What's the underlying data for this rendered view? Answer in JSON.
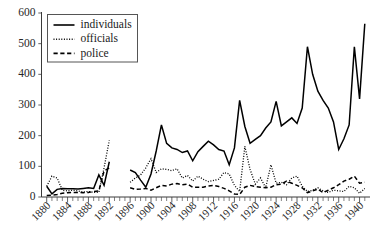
{
  "chart_data": {
    "type": "line",
    "title": "",
    "xlabel": "",
    "ylabel": "",
    "xlim": [
      1879,
      1942
    ],
    "ylim": [
      0,
      600
    ],
    "yticks": [
      0,
      100,
      200,
      300,
      400,
      500,
      600
    ],
    "xticks": [
      1880,
      1884,
      1888,
      1892,
      1896,
      1900,
      1904,
      1908,
      1912,
      1916,
      1920,
      1924,
      1928,
      1932,
      1936,
      1940
    ],
    "xtick_labels": [
      "1880",
      "1884",
      "1888",
      "1892",
      "1896",
      "1900",
      "1904",
      "1908",
      "1912",
      "1916",
      "1920",
      "1924",
      "1928",
      "1932",
      "1936",
      "1940"
    ],
    "ytick_labels": [
      "0",
      "100",
      "200",
      "300",
      "400",
      "500",
      "600"
    ],
    "xtick_minor_interval": 1,
    "grid": false,
    "legend_position": "upper-left",
    "legend_entries": [
      {
        "label": "individuals",
        "style": "solid"
      },
      {
        "label": "officials",
        "style": "dotted"
      },
      {
        "label": "police",
        "style": "dashed"
      }
    ],
    "series": [
      {
        "name": "individuals",
        "style": "solid",
        "segments": [
          {
            "x": [
              1880,
              1881,
              1882,
              1883,
              1884,
              1885,
              1886,
              1887,
              1888,
              1889,
              1890,
              1891,
              1892
            ],
            "values": [
              35,
              10,
              25,
              28,
              27,
              27,
              26,
              28,
              30,
              28,
              72,
              38,
              115
            ]
          },
          {
            "x": [
              1896,
              1897,
              1898,
              1899,
              1900,
              1901,
              1902,
              1903,
              1904,
              1905,
              1906,
              1907,
              1908,
              1909,
              1910,
              1911,
              1912,
              1913,
              1914,
              1915,
              1916,
              1917,
              1918,
              1919,
              1920,
              1921,
              1922,
              1923,
              1924,
              1925,
              1926,
              1927,
              1928,
              1929,
              1930,
              1931,
              1932,
              1933,
              1934,
              1935,
              1936,
              1937,
              1938,
              1939,
              1940,
              1941
            ],
            "values": [
              88,
              80,
              55,
              32,
              75,
              150,
              235,
              175,
              160,
              155,
              145,
              150,
              118,
              148,
              165,
              182,
              170,
              155,
              150,
              105,
              160,
              315,
              230,
              175,
              188,
              200,
              225,
              245,
              312,
              232,
              245,
              258,
              240,
              290,
              490,
              400,
              345,
              315,
              290,
              245,
              155,
              190,
              235,
              490,
              320,
              565
            ]
          }
        ]
      },
      {
        "name": "officials",
        "style": "dotted",
        "segments": [
          {
            "x": [
              1880,
              1881,
              1882,
              1883,
              1884,
              1885,
              1886,
              1887,
              1888,
              1889,
              1890,
              1891,
              1892
            ],
            "values": [
              35,
              68,
              62,
              22,
              20,
              22,
              20,
              16,
              18,
              15,
              15,
              95,
              185
            ]
          },
          {
            "x": [
              1896,
              1897,
              1898,
              1899,
              1900,
              1901,
              1902,
              1903,
              1904,
              1905,
              1906,
              1907,
              1908,
              1909,
              1910,
              1911,
              1912,
              1913,
              1914,
              1915,
              1916,
              1917,
              1918,
              1919,
              1920,
              1921,
              1922,
              1923,
              1924,
              1925,
              1926,
              1927,
              1928,
              1929,
              1930,
              1931,
              1932,
              1933,
              1934,
              1935,
              1936,
              1937,
              1938,
              1939,
              1940,
              1941
            ],
            "values": [
              48,
              62,
              72,
              95,
              125,
              80,
              92,
              90,
              86,
              92,
              62,
              70,
              52,
              68,
              58,
              50,
              54,
              58,
              80,
              75,
              38,
              18,
              165,
              90,
              42,
              62,
              30,
              105,
              45,
              48,
              40,
              62,
              68,
              35,
              18,
              22,
              30,
              20,
              15,
              22,
              20,
              18,
              35,
              30,
              12,
              28
            ]
          }
        ]
      },
      {
        "name": "police",
        "style": "dashed",
        "segments": [
          {
            "x": [
              1880,
              1881,
              1882,
              1883,
              1884,
              1885,
              1886,
              1887,
              1888,
              1889,
              1890,
              1891,
              1892
            ],
            "values": [
              5,
              6,
              8,
              12,
              14,
              15,
              15,
              14,
              15,
              18,
              20,
              85,
              95
            ]
          },
          {
            "x": [
              1896,
              1897,
              1898,
              1899,
              1900,
              1901,
              1902,
              1903,
              1904,
              1905,
              1906,
              1907,
              1908,
              1909,
              1910,
              1911,
              1912,
              1913,
              1914,
              1915,
              1916,
              1917,
              1918,
              1919,
              1920,
              1921,
              1922,
              1923,
              1924,
              1925,
              1926,
              1927,
              1928,
              1929,
              1930,
              1931,
              1932,
              1933,
              1934,
              1935,
              1936,
              1937,
              1938,
              1939,
              1940,
              1941
            ],
            "values": [
              30,
              25,
              26,
              28,
              22,
              30,
              38,
              36,
              42,
              44,
              40,
              42,
              32,
              32,
              32,
              36,
              38,
              34,
              28,
              20,
              10,
              8,
              32,
              38,
              34,
              32,
              30,
              32,
              40,
              42,
              52,
              45,
              38,
              30,
              14,
              20,
              26,
              14,
              22,
              30,
              40,
              52,
              58,
              68,
              45,
              48
            ]
          }
        ]
      }
    ]
  }
}
